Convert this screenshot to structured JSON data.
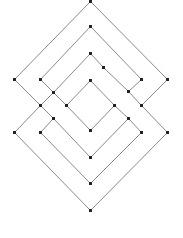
{
  "diagram": {
    "type": "braided-diamond-graph",
    "width": 183,
    "height": 238,
    "colors": {
      "background": "#ffffff",
      "edge": "#8a8a8a",
      "node": "#222222"
    },
    "edge_width": 1,
    "node_size": 3,
    "nodes": [
      {
        "id": "n0",
        "x": 90,
        "y": 1
      },
      {
        "id": "n1",
        "x": 14,
        "y": 79
      },
      {
        "id": "n2",
        "x": 167,
        "y": 79
      },
      {
        "id": "n3",
        "x": 90,
        "y": 26
      },
      {
        "id": "n4",
        "x": 40,
        "y": 79
      },
      {
        "id": "n5",
        "x": 141,
        "y": 79
      },
      {
        "id": "n6",
        "x": 90,
        "y": 53
      },
      {
        "id": "n7",
        "x": 103,
        "y": 67
      },
      {
        "id": "n8",
        "x": 53,
        "y": 92
      },
      {
        "id": "n9",
        "x": 128,
        "y": 91
      },
      {
        "id": "n10",
        "x": 90,
        "y": 80
      },
      {
        "id": "n11",
        "x": 40,
        "y": 105
      },
      {
        "id": "n12",
        "x": 66,
        "y": 105
      },
      {
        "id": "n13",
        "x": 114,
        "y": 105
      },
      {
        "id": "n14",
        "x": 141,
        "y": 105
      },
      {
        "id": "n15",
        "x": 53,
        "y": 118
      },
      {
        "id": "n16",
        "x": 128,
        "y": 118
      },
      {
        "id": "n17",
        "x": 14,
        "y": 132
      },
      {
        "id": "n18",
        "x": 40,
        "y": 132
      },
      {
        "id": "n19",
        "x": 90,
        "y": 130
      },
      {
        "id": "n20",
        "x": 141,
        "y": 132
      },
      {
        "id": "n21",
        "x": 167,
        "y": 132
      },
      {
        "id": "n22",
        "x": 90,
        "y": 157
      },
      {
        "id": "n23",
        "x": 90,
        "y": 183
      },
      {
        "id": "n24",
        "x": 90,
        "y": 210
      }
    ],
    "edges": [
      [
        "n0",
        "n1"
      ],
      [
        "n0",
        "n2"
      ],
      [
        "n1",
        "n11"
      ],
      [
        "n11",
        "n17"
      ],
      [
        "n11",
        "n15"
      ],
      [
        "n11",
        "n8"
      ],
      [
        "n17",
        "n24"
      ],
      [
        "n21",
        "n24"
      ],
      [
        "n14",
        "n21"
      ],
      [
        "n14",
        "n2"
      ],
      [
        "n14",
        "n9"
      ],
      [
        "n3",
        "n4"
      ],
      [
        "n3",
        "n5"
      ],
      [
        "n4",
        "n8"
      ],
      [
        "n8",
        "n6"
      ],
      [
        "n8",
        "n12"
      ],
      [
        "n6",
        "n7"
      ],
      [
        "n7",
        "n9"
      ],
      [
        "n9",
        "n5"
      ],
      [
        "n10",
        "n12"
      ],
      [
        "n10",
        "n13"
      ],
      [
        "n12",
        "n19"
      ],
      [
        "n13",
        "n19"
      ],
      [
        "n13",
        "n16"
      ],
      [
        "n16",
        "n20"
      ],
      [
        "n16",
        "n22"
      ],
      [
        "n15",
        "n18"
      ],
      [
        "n15",
        "n22"
      ],
      [
        "n18",
        "n23"
      ],
      [
        "n20",
        "n23"
      ]
    ]
  }
}
